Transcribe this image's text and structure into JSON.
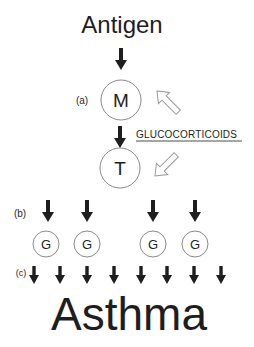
{
  "diagram": {
    "title": "Antigen",
    "outcome": "Asthma",
    "modulator": "GLUCOCORTICOIDS",
    "labels": {
      "a": "(a)",
      "b": "(b)",
      "c": "(c)"
    },
    "nodes": {
      "m": "M",
      "t": "T",
      "g": [
        "G",
        "G",
        "G",
        "G"
      ]
    },
    "colors": {
      "ink": "#1e1e1e",
      "circle_stroke": "#8a8a8a",
      "hollow_arrow": "#9a9a9a"
    }
  }
}
